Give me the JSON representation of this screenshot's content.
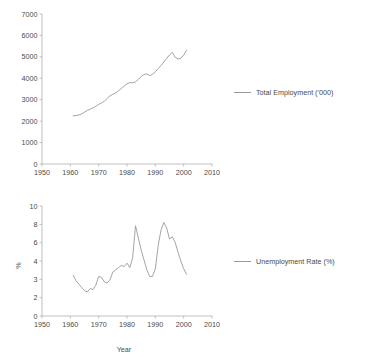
{
  "chart_data": [
    {
      "type": "line",
      "title": "",
      "xlabel": "",
      "ylabel": "",
      "xlim": [
        1950,
        2010
      ],
      "ylim": [
        0,
        7000
      ],
      "xticks": [
        "1950",
        "1960",
        "1970",
        "1980",
        "1990",
        "2000",
        "2010"
      ],
      "yticks": [
        "0",
        "1000",
        "2000",
        "3000",
        "4000",
        "5000",
        "6000",
        "7000"
      ],
      "grid": false,
      "legend_position": "right",
      "series": [
        {
          "name": "Total Employment ('000)",
          "color": "#9a9a9a",
          "x": [
            1961,
            1962,
            1963,
            1964,
            1965,
            1966,
            1967,
            1968,
            1969,
            1970,
            1971,
            1972,
            1973,
            1974,
            1975,
            1976,
            1977,
            1978,
            1979,
            1980,
            1981,
            1982,
            1983,
            1984,
            1985,
            1986,
            1987,
            1988,
            1989,
            1990,
            1991,
            1992,
            1993,
            1994,
            1995,
            1996,
            1997,
            1998,
            1999,
            2000,
            2001
          ],
          "values": [
            2250,
            2260,
            2290,
            2340,
            2420,
            2500,
            2560,
            2620,
            2700,
            2780,
            2850,
            2930,
            3060,
            3180,
            3250,
            3320,
            3420,
            3520,
            3640,
            3740,
            3800,
            3790,
            3830,
            3950,
            4080,
            4180,
            4200,
            4130,
            4180,
            4300,
            4450,
            4600,
            4760,
            4920,
            5090,
            5210,
            4980,
            4900,
            4930,
            5080,
            5300,
            5600,
            5950
          ]
        }
      ]
    },
    {
      "type": "line",
      "title": "",
      "xlabel": "Year",
      "ylabel": "%",
      "xlim": [
        1950,
        2010
      ],
      "ylim": [
        0,
        10
      ],
      "xticks": [
        "1950",
        "1960",
        "1970",
        "1980",
        "1990",
        "2000",
        "2010"
      ],
      "yticks": [
        "0",
        "2",
        "3",
        "4",
        "6",
        "8",
        "10"
      ],
      "grid": false,
      "legend_position": "right",
      "series": [
        {
          "name": "Unemployment Rate (%)",
          "color": "#9a9a9a",
          "x": [
            1961,
            1962,
            1963,
            1964,
            1965,
            1966,
            1967,
            1968,
            1969,
            1970,
            1971,
            1972,
            1973,
            1974,
            1975,
            1976,
            1977,
            1978,
            1979,
            1980,
            1981,
            1982,
            1983,
            1984,
            1985,
            1986,
            1987,
            1988,
            1989,
            1990,
            1991,
            1992,
            1993,
            1994,
            1995,
            1996,
            1997,
            1998,
            1999,
            2000,
            2001
          ],
          "values": [
            3.7,
            3.2,
            2.9,
            2.6,
            2.3,
            2.2,
            2.5,
            2.4,
            2.8,
            3.6,
            3.5,
            3.1,
            3.0,
            3.3,
            4.0,
            4.2,
            4.4,
            4.6,
            4.5,
            4.8,
            4.4,
            5.3,
            8.2,
            7.1,
            6.0,
            5.1,
            4.2,
            3.6,
            3.6,
            4.3,
            6.4,
            7.8,
            8.5,
            8.0,
            7.0,
            7.2,
            6.7,
            5.8,
            5.0,
            4.3,
            3.8,
            4.1
          ]
        }
      ]
    }
  ],
  "employment_chart": {
    "legend_label": "Total Employment ('000)"
  },
  "unemployment_chart": {
    "legend_label": "Unemployment Rate (%)",
    "y_axis_title": "%",
    "x_axis_title": "Year"
  }
}
